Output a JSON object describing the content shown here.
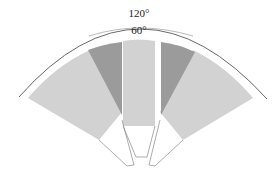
{
  "diagram": {
    "type": "motor-stator-segment",
    "labels": {
      "outer_angle": "120°",
      "inner_angle": "60°"
    },
    "colors": {
      "light_sector": "#d2d2d2",
      "dark_sector": "#9b9b9b",
      "outline": "#6a6a6a",
      "background": "#ffffff"
    }
  }
}
